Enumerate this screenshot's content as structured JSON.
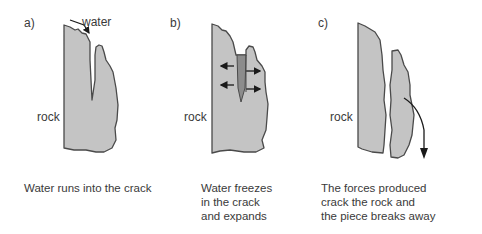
{
  "diagram": {
    "topic": "Freeze-thaw weathering of rock",
    "colors": {
      "rock_fill": "#c4c4c4",
      "ice_fill": "#8c8c8c",
      "outline": "#4a4a4a",
      "arrow": "#1a1a1a",
      "text": "#3a3a3a"
    },
    "panels": [
      {
        "label": "a)",
        "rock_label": "rock",
        "annotation": "water",
        "caption": "Water runs into the crack"
      },
      {
        "label": "b)",
        "rock_label": "rock",
        "caption": "Water freezes\nin the crack\nand expands"
      },
      {
        "label": "c)",
        "rock_label": "rock",
        "caption": "The forces produced\ncrack the rock and\nthe piece breaks away"
      }
    ]
  }
}
